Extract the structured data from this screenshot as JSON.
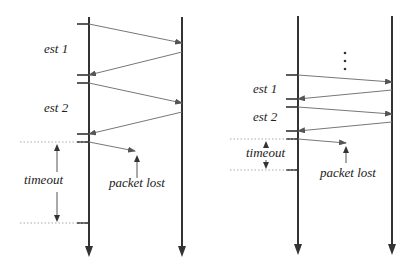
{
  "diagrams": [
    {
      "name": "left-diagram",
      "sender_x": 89,
      "receiver_x": 182,
      "top_y": 17,
      "bottom_y": 257,
      "labels": [
        {
          "text": "est 1",
          "x": 44,
          "y": 53
        },
        {
          "text": "est 2",
          "x": 44,
          "y": 112
        },
        {
          "text": "timeout",
          "x": 24,
          "y": 184
        },
        {
          "text": "packet lost",
          "x": 109,
          "y": 187
        }
      ],
      "ticks": [
        24,
        75,
        83,
        134,
        142,
        223
      ],
      "messages": [
        {
          "from": [
            89,
            24
          ],
          "to": [
            182,
            43
          ]
        },
        {
          "from": [
            182,
            52
          ],
          "to": [
            89,
            75
          ]
        },
        {
          "from": [
            89,
            83
          ],
          "to": [
            182,
            103
          ]
        },
        {
          "from": [
            182,
            112
          ],
          "to": [
            89,
            134
          ]
        }
      ],
      "lost": {
        "from": [
          89,
          142
        ],
        "to": [
          135,
          151
        ]
      },
      "lost_pointer": {
        "x": 137,
        "y1": 178,
        "y2": 155
      },
      "timeout": {
        "x": 57,
        "y1": 142,
        "y2": 223,
        "dot_x1": 20,
        "dot_x2": 86
      }
    },
    {
      "name": "right-diagram",
      "sender_x": 298,
      "receiver_x": 392,
      "top_y": 16,
      "bottom_y": 255,
      "ellipsis": {
        "x": 345,
        "ys": [
          53,
          61,
          69
        ]
      },
      "labels": [
        {
          "text": "est 1",
          "x": 253,
          "y": 93
        },
        {
          "text": "est 2",
          "x": 253,
          "y": 121
        },
        {
          "text": "timeout",
          "x": 246,
          "y": 157
        },
        {
          "text": "packet lost",
          "x": 320,
          "y": 177
        }
      ],
      "ticks": [
        75,
        99,
        107,
        131,
        139,
        170
      ],
      "messages": [
        {
          "from": [
            298,
            75
          ],
          "to": [
            392,
            82
          ]
        },
        {
          "from": [
            392,
            90
          ],
          "to": [
            298,
            99
          ]
        },
        {
          "from": [
            298,
            107
          ],
          "to": [
            392,
            114
          ]
        },
        {
          "from": [
            392,
            122
          ],
          "to": [
            298,
            131
          ]
        }
      ],
      "lost": {
        "from": [
          298,
          139
        ],
        "to": [
          346,
          143
        ]
      },
      "lost_pointer": {
        "x": 346,
        "y1": 163,
        "y2": 146
      },
      "timeout": {
        "x": 266,
        "y1": 139,
        "y2": 170,
        "dot_x1": 230,
        "dot_x2": 295,
        "up_tip": 139,
        "down_tip": 170,
        "up_end": 148,
        "down_end": 160
      }
    }
  ]
}
